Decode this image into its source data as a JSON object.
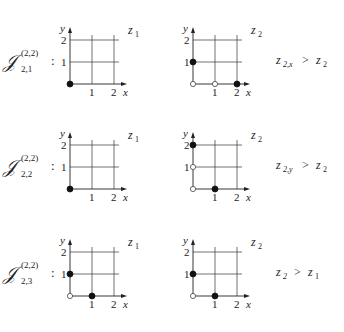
{
  "diagram": {
    "rows": [
      {
        "label": {
          "main": "𝒥",
          "sub": "2,1",
          "sup": "(2,2)",
          "colon": ":"
        },
        "left": {
          "z_label": "z",
          "z_sub": "1",
          "filled": [
            [
              0,
              0
            ]
          ],
          "hollow": []
        },
        "right": {
          "z_label": "z",
          "z_sub": "2",
          "filled": [
            [
              0,
              1
            ],
            [
              2,
              0
            ]
          ],
          "hollow": [
            [
              0,
              0
            ],
            [
              1,
              0
            ]
          ]
        },
        "relation": {
          "lhs": "z",
          "lhs_sub": "2,x",
          "op": ">",
          "rhs": "z",
          "rhs_sub": "2"
        }
      },
      {
        "label": {
          "main": "𝒥",
          "sub": "2,2",
          "sup": "(2,2)",
          "colon": ":"
        },
        "left": {
          "z_label": "z",
          "z_sub": "1",
          "filled": [
            [
              0,
              0
            ]
          ],
          "hollow": []
        },
        "right": {
          "z_label": "z",
          "z_sub": "2",
          "filled": [
            [
              0,
              2
            ],
            [
              1,
              0
            ]
          ],
          "hollow": [
            [
              0,
              0
            ],
            [
              0,
              1
            ]
          ]
        },
        "relation": {
          "lhs": "z",
          "lhs_sub": "2,y",
          "op": ">",
          "rhs": "z",
          "rhs_sub": "2"
        }
      },
      {
        "label": {
          "main": "𝒥",
          "sub": "2,3",
          "sup": "(2,2)",
          "colon": ":"
        },
        "left": {
          "z_label": "z",
          "z_sub": "1",
          "filled": [
            [
              0,
              1
            ],
            [
              1,
              0
            ]
          ],
          "hollow": [
            [
              0,
              0
            ]
          ]
        },
        "right": {
          "z_label": "z",
          "z_sub": "2",
          "filled": [
            [
              0,
              1
            ],
            [
              1,
              0
            ]
          ],
          "hollow": [
            [
              0,
              0
            ]
          ]
        },
        "relation": {
          "lhs": "z",
          "lhs_sub": "2",
          "op": ">",
          "rhs": "z",
          "rhs_sub": "1"
        }
      }
    ],
    "axes": {
      "x_label": "x",
      "y_label": "y",
      "x_ticks": [
        "1",
        "2"
      ],
      "y_ticks": [
        "1",
        "2"
      ]
    }
  }
}
